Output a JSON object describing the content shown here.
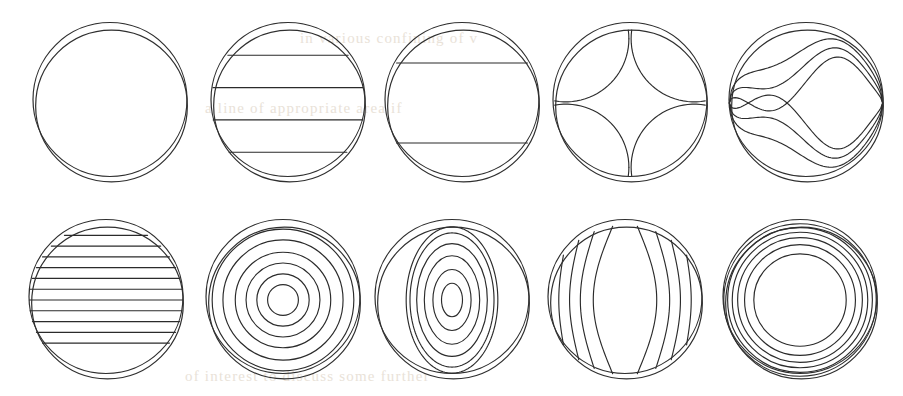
{
  "figure": {
    "width": 903,
    "height": 396,
    "background_color": "#ffffff",
    "stroke_color": "#2b2b2b",
    "rows": 2,
    "columns": 5,
    "panel_count": 10
  },
  "bleed_text": {
    "line1": "in various confining of v",
    "line2": "a line of appropriate area if",
    "line3": "of interest to discuss some further"
  },
  "chart_data": {
    "type": "line",
    "xlabel": "",
    "ylabel": "",
    "grid": false,
    "legend": "none",
    "panels": [
      {
        "index": 1,
        "row": 1,
        "column": 1,
        "label": "empty-field",
        "center": [
          110,
          103
        ],
        "radius": 77,
        "contour_kind": "none",
        "contour_count": 0,
        "contour_levels": [],
        "notes": "Plain circular boundary only, no interior contours."
      },
      {
        "index": 2,
        "row": 1,
        "column": 2,
        "label": "horizontal-bands-4",
        "center": [
          288,
          103
        ],
        "radius": 77,
        "contour_kind": "horizontal",
        "contour_count": 4,
        "contour_levels": [
          -0.62,
          -0.2,
          0.22,
          0.64
        ],
        "notes": "Four horizontal chords spanning the disc."
      },
      {
        "index": 3,
        "row": 1,
        "column": 3,
        "label": "horizontal-bands-2",
        "center": [
          462,
          103
        ],
        "radius": 77,
        "contour_kind": "horizontal",
        "contour_count": 2,
        "contour_levels": [
          -0.52,
          0.52
        ],
        "notes": "Two horizontal chords near the top and bottom."
      },
      {
        "index": 4,
        "row": 1,
        "column": 4,
        "label": "four-petal",
        "center": [
          630,
          103
        ],
        "radius": 77,
        "contour_kind": "petal",
        "contour_count": 4,
        "contour_levels": [
          0.74,
          0.74,
          0.74,
          0.74
        ],
        "notes": "Four corner lune arcs forming a rounded-square central cell."
      },
      {
        "index": 5,
        "row": 1,
        "column": 5,
        "label": "wave-s-curves",
        "center": [
          806,
          103
        ],
        "radius": 77,
        "contour_kind": "wave",
        "contour_count": 6,
        "contour_levels": [
          -0.78,
          -0.55,
          -0.3,
          0.3,
          0.55,
          0.78
        ],
        "notes": "Sigmoid/S-shaped contours; antisymmetric about the horizontal midline."
      },
      {
        "index": 6,
        "row": 2,
        "column": 1,
        "label": "horizontal-stripes-11",
        "center": [
          106,
          300
        ],
        "radius": 77,
        "contour_kind": "horizontal",
        "contour_count": 11,
        "contour_levels": [
          -0.84,
          -0.7,
          -0.56,
          -0.42,
          -0.28,
          -0.14,
          0.0,
          0.14,
          0.28,
          0.42,
          0.56
        ],
        "notes": "Dense evenly spaced horizontal chords across the disc."
      },
      {
        "index": 7,
        "row": 2,
        "column": 2,
        "label": "concentric-circles",
        "center": [
          283,
          300
        ],
        "radius": 77,
        "contour_kind": "concentric-circular",
        "contour_count": 6,
        "contour_levels": [
          0.2,
          0.34,
          0.48,
          0.62,
          0.78,
          0.92
        ],
        "notes": "Six nested circles, radially monotone bullseye pattern."
      },
      {
        "index": 8,
        "row": 2,
        "column": 3,
        "label": "concentric-ellipses-vertical",
        "center": [
          452,
          300
        ],
        "radius": 77,
        "contour_kind": "concentric-elliptical",
        "contour_count": 6,
        "contour_levels": [
          0.22,
          0.4,
          0.58,
          0.74,
          0.88,
          0.96
        ],
        "notes": "Vertically elongated nested ellipses, outer ones clipped by the disc."
      },
      {
        "index": 9,
        "row": 2,
        "column": 4,
        "label": "vertical-wavy-lines",
        "center": [
          625,
          300
        ],
        "radius": 77,
        "contour_kind": "vertical",
        "contour_count": 8,
        "contour_levels": [
          -0.8,
          -0.6,
          -0.4,
          -0.16,
          0.16,
          0.4,
          0.6,
          0.8
        ],
        "notes": "Vertical contours bulging outward toward the mid-height."
      },
      {
        "index": 10,
        "row": 2,
        "column": 5,
        "label": "concentric-circles-edge-packed",
        "center": [
          800,
          300
        ],
        "radius": 77,
        "contour_kind": "concentric-circular",
        "contour_count": 6,
        "contour_levels": [
          0.6,
          0.72,
          0.81,
          0.88,
          0.94,
          0.99
        ],
        "notes": "Nested circles packed near the rim leaving a large flat core."
      }
    ]
  }
}
